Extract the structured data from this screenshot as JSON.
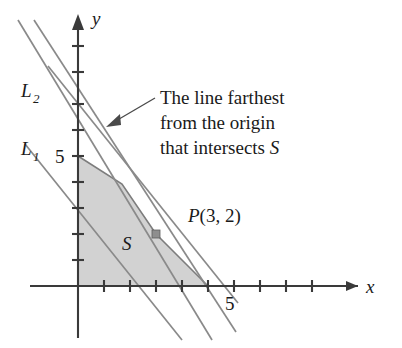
{
  "figure": {
    "type": "linear-programming-feasible-region",
    "axes": {
      "x_label": "x",
      "y_label": "y",
      "x_tick_label": "5",
      "y_tick_label": "5",
      "x_tick_label_value": 5,
      "y_tick_label_value": 5,
      "x_ticks": [
        1,
        2,
        3,
        4,
        5,
        6,
        7,
        8,
        9
      ],
      "y_ticks": [
        1,
        2,
        3,
        4,
        5,
        6,
        7,
        8
      ],
      "origin_px": [
        78,
        286
      ],
      "unit_px": 26
    },
    "lines": [
      {
        "id": "L1",
        "label": "L",
        "sublabel": "1"
      },
      {
        "id": "L2",
        "label": "L",
        "sublabel": "2"
      }
    ],
    "region": {
      "label": "S",
      "vertices": [
        [
          0,
          0
        ],
        [
          0,
          5
        ],
        [
          1.7,
          3.9
        ],
        [
          3,
          2
        ],
        [
          5,
          0
        ]
      ]
    },
    "point": {
      "label_prefix": "P",
      "label_coords": "(3, 2)",
      "x": 3,
      "y": 2
    },
    "annotation": {
      "line1": "The line farthest",
      "line2": "from the origin",
      "line3_prefix": "that intersects ",
      "line3_italic": "S"
    },
    "colors": {
      "region_fill": "#d2d2d2",
      "region_edge": "#7d7d7d",
      "axis": "#3a3a3a",
      "constraint_line": "#8a8a8a",
      "text": "#1a1a1a"
    }
  }
}
